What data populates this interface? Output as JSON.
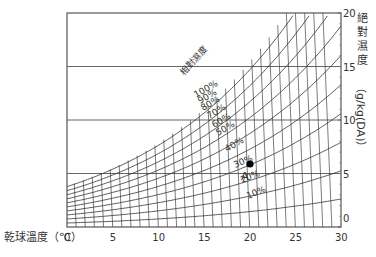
{
  "chart_data": {
    "type": "line",
    "xlabel": "乾球溫度（℃）",
    "ylabel": "絕對濕度（g/kg(DA)）",
    "ylabel_parts": [
      "絕",
      "對",
      "濕",
      "度",
      "（g/kg(DA)）"
    ],
    "xlim": [
      0,
      30
    ],
    "ylim": [
      0,
      20
    ],
    "x_ticks": [
      0,
      5,
      10,
      15,
      20,
      25,
      30
    ],
    "y_ticks": [
      0,
      5,
      10,
      15,
      20
    ],
    "grid": true,
    "curve_family_label": "相對濕度",
    "series": [
      {
        "name": "100%",
        "rh": 100
      },
      {
        "name": "90%",
        "rh": 90
      },
      {
        "name": "80%",
        "rh": 80
      },
      {
        "name": "70%",
        "rh": 70
      },
      {
        "name": "60%",
        "rh": 60
      },
      {
        "name": "50%",
        "rh": 50
      },
      {
        "name": "40%",
        "rh": 40
      },
      {
        "name": "30%",
        "rh": 30
      },
      {
        "name": "20%",
        "rh": 20
      },
      {
        "name": "10%",
        "rh": 10
      }
    ],
    "annotations": [
      {
        "label": "A",
        "x": 20,
        "y": 5.9,
        "note": "state point ≈ 20℃, ~40% RH"
      }
    ]
  }
}
